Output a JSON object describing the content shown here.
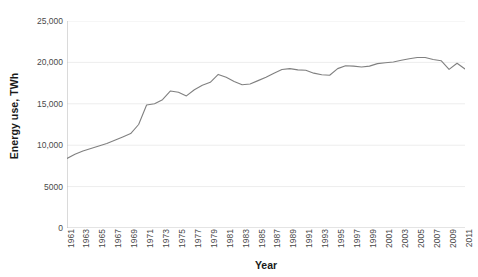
{
  "chart_data": {
    "type": "line",
    "title": "",
    "xlabel": "Year",
    "ylabel": "Energy use, TWh",
    "ylim": [
      0,
      25000
    ],
    "xlim": [
      1961,
      2011
    ],
    "grid": true,
    "grid_axis": "y",
    "legend": false,
    "line_color": "#808080",
    "y_ticks": [
      0,
      5000,
      10000,
      15000,
      20000,
      25000
    ],
    "y_tick_labels": [
      "0",
      "5000",
      "10,000",
      "15,000",
      "20,000",
      "25,000"
    ],
    "x_tick_labels": [
      "1961",
      "1963",
      "1965",
      "1967",
      "1969",
      "1971",
      "1973",
      "1975",
      "1977",
      "1979",
      "1981",
      "1983",
      "1985",
      "1987",
      "1989",
      "1991",
      "1993",
      "1995",
      "1997",
      "1999",
      "2001",
      "2003",
      "2005",
      "2007",
      "2009",
      "2011"
    ],
    "x": [
      1961,
      1962,
      1963,
      1964,
      1965,
      1966,
      1967,
      1968,
      1969,
      1970,
      1971,
      1972,
      1973,
      1974,
      1975,
      1976,
      1977,
      1978,
      1979,
      1980,
      1981,
      1982,
      1983,
      1984,
      1985,
      1986,
      1987,
      1988,
      1989,
      1990,
      1991,
      1992,
      1993,
      1994,
      1995,
      1996,
      1997,
      1998,
      1999,
      2000,
      2001,
      2002,
      2003,
      2004,
      2005,
      2006,
      2007,
      2008,
      2009,
      2010,
      2011
    ],
    "values": [
      8400,
      8900,
      9300,
      9600,
      9900,
      10200,
      10600,
      11000,
      11400,
      12500,
      14850,
      15000,
      15500,
      16550,
      16400,
      15950,
      16700,
      17250,
      17600,
      18550,
      18200,
      17700,
      17300,
      17400,
      17800,
      18200,
      18700,
      19150,
      19250,
      19100,
      19050,
      18700,
      18500,
      18450,
      19250,
      19600,
      19550,
      19450,
      19550,
      19850,
      19950,
      20050,
      20250,
      20450,
      20600,
      20600,
      20350,
      20200,
      19150,
      19900,
      19200
    ],
    "series_name": "Energy use"
  },
  "axes": {
    "y_title": "Energy use, TWh",
    "x_title": "Year"
  }
}
